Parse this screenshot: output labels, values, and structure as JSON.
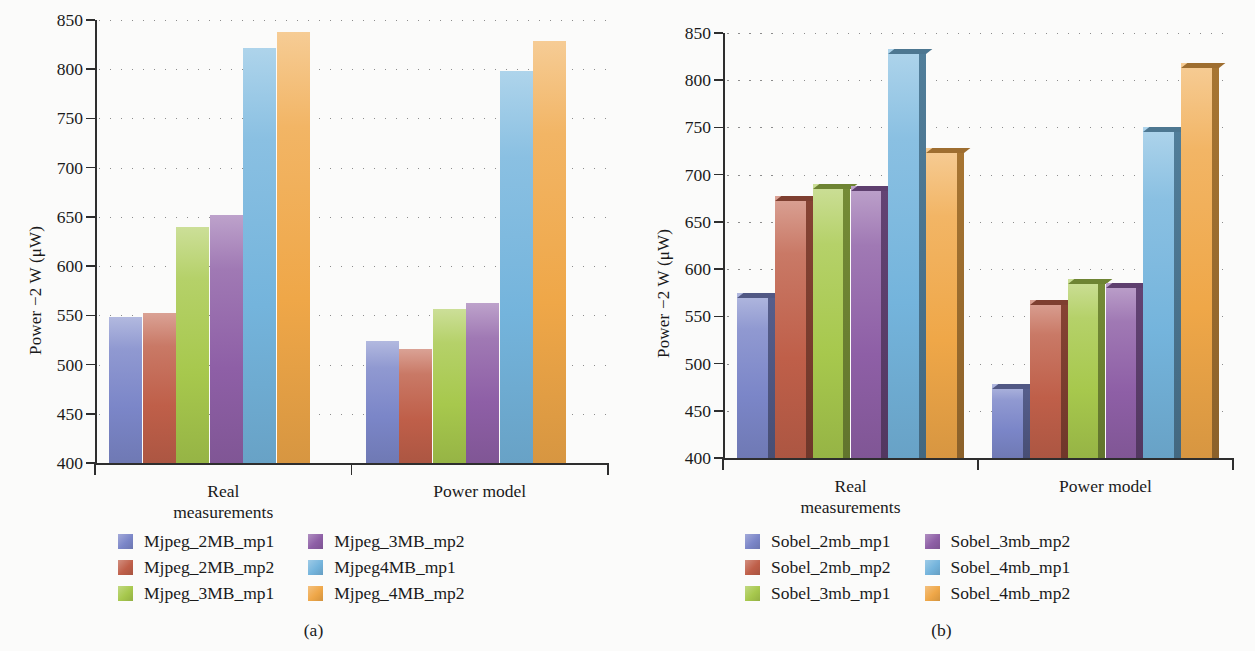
{
  "figure": {
    "panels": [
      {
        "caption": "(a)",
        "ylabel": "Power −2 W (μW)",
        "categories": [
          "Real\nmeasurements",
          "Power model"
        ],
        "category_lines": [
          [
            "Real",
            "measurements"
          ],
          [
            "Power model"
          ]
        ],
        "yticks": [
          "400",
          "450",
          "500",
          "550",
          "600",
          "650",
          "700",
          "750",
          "800",
          "850"
        ],
        "legend": [
          {
            "label": "Mjpeg_2MB_mp1",
            "color": "#7b86c8"
          },
          {
            "label": "Mjpeg_2MB_mp2",
            "color": "#bf5f49"
          },
          {
            "label": "Mjpeg_3MB_mp1",
            "color": "#a7c84d"
          },
          {
            "label": "Mjpeg_3MB_mp2",
            "color": "#8e5fa6"
          },
          {
            "label": "Mjpeg4MB_mp1",
            "color": "#74b4dc"
          },
          {
            "label": "Mjpeg_4MB_mp2",
            "color": "#efa748"
          }
        ]
      },
      {
        "caption": "(b)",
        "ylabel": "Power −2 W (μW)",
        "categories": [
          "Real\nmeasurements",
          "Power model"
        ],
        "category_lines": [
          [
            "Real",
            "measurements"
          ],
          [
            "Power model"
          ]
        ],
        "yticks": [
          "400",
          "450",
          "500",
          "550",
          "600",
          "650",
          "700",
          "750",
          "800",
          "850"
        ],
        "legend": [
          {
            "label": "Sobel_2mb_mp1",
            "color": "#7b86c8"
          },
          {
            "label": "Sobel_2mb_mp2",
            "color": "#bf5f49"
          },
          {
            "label": "Sobel_3mb_mp1",
            "color": "#a7c84d"
          },
          {
            "label": "Sobel_3mb_mp2",
            "color": "#8e5fa6"
          },
          {
            "label": "Sobel_4mb_mp1",
            "color": "#74b4dc"
          },
          {
            "label": "Sobel_4mb_mp2",
            "color": "#efa748"
          }
        ]
      }
    ]
  },
  "chart_data": [
    {
      "type": "bar",
      "title": "(a)",
      "xlabel": "",
      "ylabel": "Power −2 W (μW)",
      "ylim": [
        400,
        850
      ],
      "ytick_step": 50,
      "grid": true,
      "grid_style": "dotted-horizontal",
      "legend_position": "below",
      "style": "flat-2d",
      "categories": [
        "Real measurements",
        "Power model"
      ],
      "series": [
        {
          "name": "Mjpeg_2MB_mp1",
          "color": "#7b86c8",
          "values": [
            548,
            524
          ]
        },
        {
          "name": "Mjpeg_2MB_mp2",
          "color": "#bf5f49",
          "values": [
            552,
            516
          ]
        },
        {
          "name": "Mjpeg_3MB_mp1",
          "color": "#a7c84d",
          "values": [
            640,
            556
          ]
        },
        {
          "name": "Mjpeg_3MB_mp2",
          "color": "#8e5fa6",
          "values": [
            652,
            563
          ]
        },
        {
          "name": "Mjpeg4MB_mp1",
          "color": "#74b4dc",
          "values": [
            822,
            798
          ]
        },
        {
          "name": "Mjpeg_4MB_mp2",
          "color": "#efa748",
          "values": [
            838,
            829
          ]
        }
      ]
    },
    {
      "type": "bar",
      "title": "(b)",
      "xlabel": "",
      "ylabel": "Power −2 W (μW)",
      "ylim": [
        400,
        850
      ],
      "ytick_step": 50,
      "grid": true,
      "grid_style": "dotted-horizontal",
      "legend_position": "below",
      "style": "3d-extruded",
      "categories": [
        "Real measurements",
        "Power model"
      ],
      "series": [
        {
          "name": "Sobel_2mb_mp1",
          "color": "#7b86c8",
          "values": [
            575,
            478
          ]
        },
        {
          "name": "Sobel_2mb_mp2",
          "color": "#bf5f49",
          "values": [
            677,
            567
          ]
        },
        {
          "name": "Sobel_3mb_mp1",
          "color": "#a7c84d",
          "values": [
            690,
            590
          ]
        },
        {
          "name": "Sobel_3mb_mp2",
          "color": "#8e5fa6",
          "values": [
            688,
            585
          ]
        },
        {
          "name": "Sobel_4mb_mp1",
          "color": "#74b4dc",
          "values": [
            833,
            750
          ]
        },
        {
          "name": "Sobel_4mb_mp2",
          "color": "#efa748",
          "values": [
            728,
            818
          ]
        }
      ]
    }
  ]
}
